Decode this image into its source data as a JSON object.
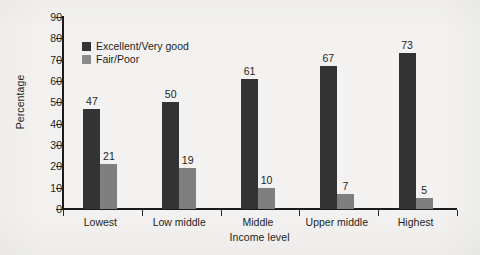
{
  "chart_data": {
    "type": "bar",
    "title": "",
    "subtitle": "",
    "xlabel": "Income level",
    "ylabel": "Percentage",
    "categories": [
      "Lowest",
      "Low middle",
      "Middle",
      "Upper middle",
      "Highest"
    ],
    "series": [
      {
        "name": "Excellent/Very good",
        "color": "#333333",
        "values": [
          47,
          50,
          61,
          67,
          73
        ]
      },
      {
        "name": "Fair/Poor",
        "color": "#7f7f7f",
        "values": [
          21,
          19,
          10,
          7,
          5
        ]
      }
    ],
    "ylim": [
      0,
      90
    ],
    "ytick_step": 10,
    "yticks": [
      0,
      10,
      20,
      30,
      40,
      50,
      60,
      70,
      80,
      90
    ],
    "ytick_labels": [
      "0",
      "10",
      "20",
      "30",
      "40",
      "50",
      "60",
      "70",
      "80",
      "90"
    ],
    "grid": false,
    "legend_position": "upper left (inside plot area)",
    "data_labels": true,
    "bar_grouping": "grouped",
    "axis_style": "left and bottom spines only, outward ticks",
    "background_color": "#f3f2f0",
    "text_color": "#1e1e1e"
  }
}
